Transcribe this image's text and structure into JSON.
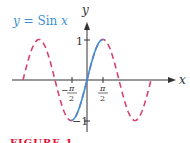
{
  "chart_data": {
    "type": "line",
    "title": "y = Sin x",
    "xlabel": "x",
    "ylabel": "y",
    "x_ticks": [
      "-π/2",
      "π/2"
    ],
    "y_ticks": [
      "1",
      "-1"
    ],
    "series": [
      {
        "name": "y = sin x (dashed)",
        "style": "dashed",
        "color": "#d9416e",
        "x_range": [
          "-5π/2",
          "5π/2"
        ]
      },
      {
        "name": "y = Sin x (restricted)",
        "style": "solid",
        "color": "#3b8fd6",
        "x_range": [
          "-π/2",
          "π/2"
        ]
      }
    ],
    "ylim": [
      -1,
      1
    ]
  },
  "labels": {
    "function": "y = Sin x",
    "x_axis": "x",
    "y_axis": "y",
    "one": "1",
    "neg_one": "−1",
    "pi": "π",
    "two": "2",
    "minus": "−"
  },
  "caption": "FIGURE 1",
  "colors": {
    "dashed": "#d9416e",
    "solid": "#3b8fd6",
    "axis": "#333333",
    "caption": "#e0103a"
  }
}
